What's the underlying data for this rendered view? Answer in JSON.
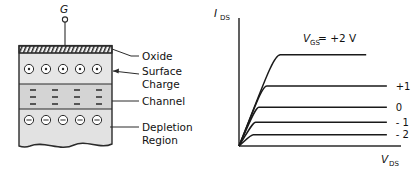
{
  "figure": {
    "left_diagram": {
      "name": "mosfet-cross-section",
      "gate_terminal": "G",
      "callouts": [
        {
          "key": "oxide",
          "label": "Oxide"
        },
        {
          "key": "surface_charge",
          "label": "Surface"
        },
        {
          "key": "surface_charge2",
          "label": "Charge"
        },
        {
          "key": "channel",
          "label": "Channel"
        },
        {
          "key": "depletion",
          "label": "Depletion"
        },
        {
          "key": "depletion2",
          "label": "Region"
        }
      ],
      "layers": [
        {
          "key": "oxide",
          "fill": "#e8e8e8",
          "hatched": true
        },
        {
          "key": "surface_charge",
          "fill": "#dcdcdc",
          "symbol": "circle-dot",
          "count": 5
        },
        {
          "key": "channel",
          "fill": "#d2d2d2",
          "symbol": "minus",
          "columns": 4,
          "rows": 3
        },
        {
          "key": "depletion",
          "fill": "#dcdcdc",
          "symbol": "circle-minus",
          "count": 5
        }
      ]
    },
    "right_chart": {
      "name": "output-characteristics"
    }
  },
  "chart_data": {
    "type": "line",
    "title": "",
    "xlabel": "V_DS",
    "ylabel": "I_DS",
    "xlabel_main": "V",
    "xlabel_sub": "DS",
    "ylabel_main": "I",
    "ylabel_sub": "DS",
    "xlim": [
      0,
      1
    ],
    "ylim": [
      0,
      1
    ],
    "grid": false,
    "legend": "right-of-curves",
    "annotation": {
      "main": "V",
      "sub": "GS",
      "rest": " = +2 V"
    },
    "series": [
      {
        "name": "+2",
        "label": "V_GS = +2 V",
        "plateau": 0.86,
        "knee_x": 0.26,
        "label_x": 0.42,
        "label_y": 0.97
      },
      {
        "name": "+1",
        "label": "+1",
        "plateau": 0.565,
        "knee_x": 0.175,
        "label_x": 1.04,
        "label_y": 0.565
      },
      {
        "name": "0",
        "label": "0",
        "plateau": 0.365,
        "knee_x": 0.125,
        "label_x": 1.04,
        "label_y": 0.365
      },
      {
        "name": "-1",
        "label": "- 1",
        "plateau": 0.225,
        "knee_x": 0.105,
        "label_x": 1.04,
        "label_y": 0.225
      },
      {
        "name": "-2",
        "label": "- 2",
        "plateau": 0.105,
        "knee_x": 0.09,
        "label_x": 1.04,
        "label_y": 0.105
      }
    ]
  }
}
